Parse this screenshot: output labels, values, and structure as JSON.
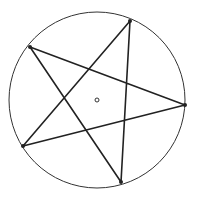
{
  "diagram": {
    "type": "pentagram-in-circle",
    "circle": {
      "cx": 97,
      "cy": 100,
      "r": 88,
      "stroke": "#333333"
    },
    "center_point": {
      "cx": 97,
      "cy": 100,
      "r": 2
    },
    "vertices": [
      {
        "x": 130,
        "y": 21
      },
      {
        "x": 185,
        "y": 105
      },
      {
        "x": 121,
        "y": 182
      },
      {
        "x": 23,
        "y": 146
      },
      {
        "x": 30,
        "y": 47
      }
    ],
    "star_order": [
      0,
      2,
      4,
      1,
      3
    ],
    "line_color": "#222222"
  }
}
